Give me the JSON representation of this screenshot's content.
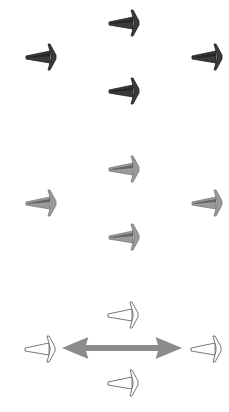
{
  "groups": [
    {
      "name": "dark-cones",
      "fill": "#3a3a3a",
      "stroke": "#222222",
      "top": 8,
      "cones": [
        {
          "position": "top",
          "x": 107,
          "y": 0
        },
        {
          "position": "left",
          "x": 24,
          "y": 34
        },
        {
          "position": "right",
          "x": 190,
          "y": 34
        },
        {
          "position": "bottom",
          "x": 107,
          "y": 68
        }
      ]
    },
    {
      "name": "gray-cones",
      "fill": "#9a9a9a",
      "stroke": "#7a7a7a",
      "top": 154,
      "cones": [
        {
          "position": "top",
          "x": 107,
          "y": 0
        },
        {
          "position": "left",
          "x": 24,
          "y": 34
        },
        {
          "position": "right",
          "x": 190,
          "y": 34
        },
        {
          "position": "bottom",
          "x": 107,
          "y": 68
        }
      ]
    },
    {
      "name": "outline-cones",
      "fill": "#ffffff",
      "stroke": "#555555",
      "top": 300,
      "cones": [
        {
          "position": "top",
          "x": 106,
          "y": 0
        },
        {
          "position": "left",
          "x": 23,
          "y": 34
        },
        {
          "position": "right",
          "x": 189,
          "y": 34
        },
        {
          "position": "bottom",
          "x": 106,
          "y": 68
        }
      ],
      "double_arrow": {
        "x1": 62,
        "x2": 182,
        "y": 348,
        "color": "#8c8c8c"
      }
    }
  ]
}
